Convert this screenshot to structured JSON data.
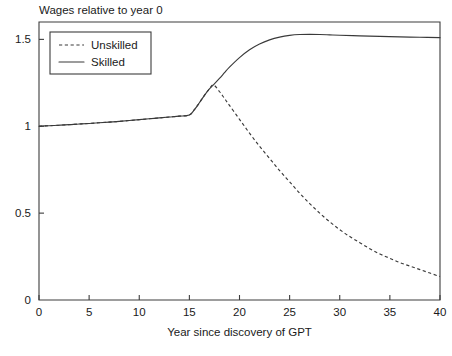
{
  "chart_data": {
    "type": "line",
    "title": "Wages relative to year 0",
    "xlabel": "Year since discovery of GPT",
    "ylabel": "",
    "xlim": [
      0,
      40
    ],
    "ylim": [
      0,
      1.6
    ],
    "grid": false,
    "legend_position": "top-left",
    "xticks": [
      0,
      5,
      10,
      15,
      20,
      25,
      30,
      35,
      40
    ],
    "xticklabels": [
      "0",
      "5",
      "10",
      "15",
      "20",
      "25",
      "30",
      "35",
      "40"
    ],
    "yticks": [
      0,
      0.5,
      1,
      1.5
    ],
    "yticklabels": [
      "0",
      "0.5",
      "1",
      "1.5"
    ],
    "series": [
      {
        "name": "Unskilled",
        "style": "dashed",
        "color": "#3a3a3a",
        "x": [
          0,
          1,
          2,
          3,
          4,
          5,
          6,
          7,
          8,
          9,
          10,
          11,
          12,
          13,
          14,
          15,
          15.5,
          16,
          16.5,
          17,
          17.4,
          18,
          18.5,
          19,
          20,
          21,
          22,
          23,
          24,
          25,
          26,
          27,
          28,
          29,
          30,
          31,
          32,
          33,
          34,
          35,
          36,
          37,
          38,
          39,
          40
        ],
        "y": [
          1.0,
          1.003,
          1.006,
          1.009,
          1.013,
          1.016,
          1.02,
          1.024,
          1.028,
          1.033,
          1.038,
          1.043,
          1.048,
          1.053,
          1.058,
          1.065,
          1.095,
          1.135,
          1.178,
          1.215,
          1.238,
          1.2,
          1.16,
          1.12,
          1.04,
          0.96,
          0.885,
          0.815,
          0.745,
          0.68,
          0.615,
          0.555,
          0.5,
          0.45,
          0.405,
          0.365,
          0.33,
          0.295,
          0.265,
          0.24,
          0.215,
          0.195,
          0.175,
          0.155,
          0.135
        ]
      },
      {
        "name": "Skilled",
        "style": "solid",
        "color": "#3a3a3a",
        "x": [
          0,
          1,
          2,
          3,
          4,
          5,
          6,
          7,
          8,
          9,
          10,
          11,
          12,
          13,
          14,
          15,
          15.5,
          16,
          16.5,
          17,
          17.4,
          18,
          18.5,
          19,
          20,
          21,
          22,
          23,
          24,
          25,
          26,
          27,
          28,
          29,
          30,
          32,
          34,
          36,
          38,
          40
        ],
        "y": [
          1.0,
          1.003,
          1.006,
          1.009,
          1.013,
          1.016,
          1.02,
          1.024,
          1.028,
          1.033,
          1.038,
          1.043,
          1.048,
          1.053,
          1.058,
          1.065,
          1.095,
          1.135,
          1.178,
          1.215,
          1.238,
          1.275,
          1.308,
          1.34,
          1.395,
          1.44,
          1.473,
          1.497,
          1.513,
          1.523,
          1.528,
          1.529,
          1.528,
          1.526,
          1.524,
          1.52,
          1.517,
          1.514,
          1.512,
          1.51
        ]
      }
    ],
    "legend": [
      {
        "label": "Unskilled",
        "style": "dashed"
      },
      {
        "label": "Skilled",
        "style": "solid"
      }
    ]
  }
}
